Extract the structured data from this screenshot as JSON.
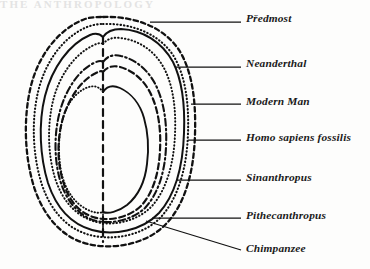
{
  "page": {
    "header_text": "THE ANTHROPOLOGY",
    "background_color": "#fdfdfc",
    "ink_color": "#111111"
  },
  "figure": {
    "name": "comparative-cranial-outlines",
    "midline_style": "dashed",
    "contours": [
      {
        "id": "predmost",
        "label": "Předmost",
        "line_style": "dashed",
        "order": 1
      },
      {
        "id": "neanderthal",
        "label": "Neanderthal",
        "line_style": "dotted",
        "order": 2
      },
      {
        "id": "modern-man",
        "label": "Modern Man",
        "line_style": "solid",
        "order": 3
      },
      {
        "id": "homo-sapiens-fossilis",
        "label": "Homo sapiens fossilis",
        "line_style": "dotted",
        "order": 4
      },
      {
        "id": "sinanthropus",
        "label": "Sinanthropus",
        "line_style": "dash-dot",
        "order": 5
      },
      {
        "id": "pithecanthropus",
        "label": "Pithecanthropus",
        "line_style": "dashed",
        "order": 6
      },
      {
        "id": "chimpanzee",
        "label": "Chimpanzee",
        "line_style": "solid",
        "order": 7
      }
    ]
  },
  "labels": [
    {
      "id": "predmost",
      "text": "Předmost",
      "x": 246,
      "y": 14,
      "leader_from_x": 150,
      "leader_from_y": 22,
      "leader_to_x": 240,
      "leader_to_y": 22
    },
    {
      "id": "neanderthal",
      "text": "Neanderthal",
      "x": 246,
      "y": 59,
      "leader_from_x": 175,
      "leader_from_y": 67,
      "leader_to_x": 240,
      "leader_to_y": 67
    },
    {
      "id": "modern-man",
      "text": "Modern Man",
      "x": 246,
      "y": 97,
      "leader_from_x": 192,
      "leader_from_y": 105,
      "leader_to_x": 240,
      "leader_to_y": 105
    },
    {
      "id": "homo-sapiens-fossilis",
      "text": "Homo sapiens fossilis",
      "x": 246,
      "y": 133,
      "leader_from_x": 190,
      "leader_from_y": 141,
      "leader_to_x": 240,
      "leader_to_y": 141
    },
    {
      "id": "sinanthropus",
      "text": "Sinanthropus",
      "x": 246,
      "y": 173,
      "leader_from_x": 178,
      "leader_from_y": 181,
      "leader_to_x": 240,
      "leader_to_y": 181
    },
    {
      "id": "pithecanthropus",
      "text": "Pithecanthropus",
      "x": 246,
      "y": 212,
      "leader_from_x": 158,
      "leader_from_y": 219,
      "leader_to_x": 240,
      "leader_to_y": 219
    },
    {
      "id": "chimpanzee",
      "text": "Chimpanzee",
      "x": 246,
      "y": 245,
      "leader_from_x": 150,
      "leader_from_y": 222,
      "leader_to_x": 240,
      "leader_to_y": 251
    }
  ]
}
